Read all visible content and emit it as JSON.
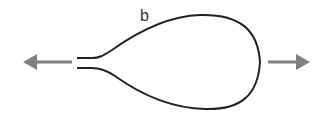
{
  "diagram": {
    "label": "b",
    "loop_color": "#222222",
    "arrow_color": "#808080",
    "arrows": [
      {
        "direction": "left"
      },
      {
        "direction": "right"
      }
    ]
  }
}
